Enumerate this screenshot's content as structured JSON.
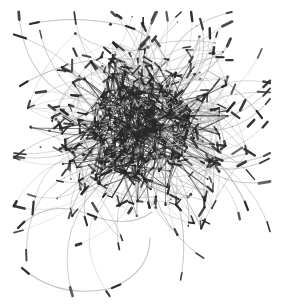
{
  "figure": {
    "kind": "network-graph",
    "title": "",
    "width": 283,
    "height": 307,
    "background_color": "#ffffff",
    "alt_text": "Force-directed network graph with dense dark hairball core and light gray curved edges radiating outward ending in dark tapered tips"
  },
  "chart_data": {
    "type": "scatter",
    "title": "",
    "subtitle": "",
    "xlabel": "",
    "ylabel": "",
    "xlim": [
      0,
      283
    ],
    "ylim": [
      0,
      307
    ],
    "grid": false,
    "legend": null,
    "annotations": [],
    "layout": "force-directed",
    "core_center": [
      140,
      130
    ],
    "core_radius": 52,
    "halo_radius": 110,
    "node_count": 420,
    "edge_count": 760,
    "edge_style": "curved-tapered",
    "edge_color_light": "#b8b8b8",
    "edge_color_dark": "#2b2b2b",
    "node_color": "#262626",
    "tip_color": "#1a1a1a",
    "peripheral_tendrils": 96,
    "outlier_arcs": [
      {
        "start": [
          22,
          268
        ],
        "ctrl": [
          60,
          300
        ],
        "end": [
          112,
          288
        ]
      },
      {
        "start": [
          112,
          288
        ],
        "ctrl": [
          150,
          272
        ],
        "end": [
          150,
          238
        ]
      },
      {
        "start": [
          18,
          228
        ],
        "ctrl": [
          48,
          198
        ],
        "end": [
          88,
          214
        ]
      },
      {
        "start": [
          88,
          214
        ],
        "ctrl": [
          128,
          230
        ],
        "end": [
          152,
          212
        ]
      },
      {
        "start": [
          30,
          24
        ],
        "ctrl": [
          78,
          14
        ],
        "end": [
          126,
          26
        ]
      },
      {
        "start": [
          126,
          26
        ],
        "ctrl": [
          160,
          38
        ],
        "end": [
          168,
          66
        ]
      },
      {
        "start": [
          20,
          86
        ],
        "ctrl": [
          56,
          64
        ],
        "end": [
          96,
          60
        ]
      },
      {
        "start": [
          262,
          118
        ],
        "ctrl": [
          238,
          86
        ],
        "end": [
          206,
          70
        ]
      },
      {
        "start": [
          248,
          210
        ],
        "ctrl": [
          236,
          178
        ],
        "end": [
          208,
          154
        ]
      }
    ],
    "density_profile": {
      "description": "radial density falls off from dense core to sparse periphery",
      "radii": [
        0,
        20,
        40,
        60,
        80,
        100,
        130
      ],
      "relative_density": [
        1.0,
        0.95,
        0.72,
        0.42,
        0.2,
        0.08,
        0.02
      ]
    }
  }
}
